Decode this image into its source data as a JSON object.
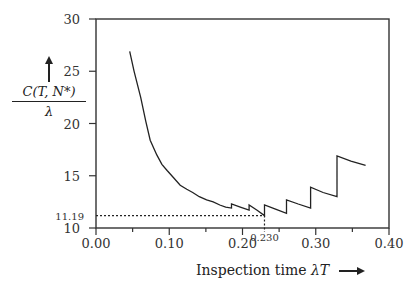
{
  "chart_data": {
    "type": "line",
    "title": "",
    "xlabel": "Inspection time λT",
    "ylabel": "C(T, N*) / λ",
    "ylabel_parts": {
      "numerator": "C(T, N*)",
      "denominator": "λ"
    },
    "xlim": [
      0.0,
      0.4
    ],
    "ylim": [
      10,
      30
    ],
    "grid": false,
    "legend": null,
    "x_ticks": [
      0.0,
      0.05,
      0.1,
      0.15,
      0.2,
      0.25,
      0.3,
      0.35,
      0.4
    ],
    "x_tick_labels": [
      "0.00",
      "",
      "0.10",
      "",
      "0.20",
      "",
      "0.30",
      "",
      "0.40"
    ],
    "y_ticks": [
      10,
      15,
      20,
      25,
      30
    ],
    "y_tick_labels": [
      "10",
      "15",
      "20",
      "25",
      "30"
    ],
    "series": [
      {
        "name": "C(T,N*)/λ",
        "style": "step-sawtooth",
        "x": [
          0.046,
          0.052,
          0.061,
          0.068,
          0.074,
          0.083,
          0.09,
          0.097,
          0.106,
          0.115,
          0.124,
          0.132,
          0.141,
          0.151,
          0.16,
          0.169,
          0.177,
          0.185,
          0.185,
          0.197,
          0.209,
          0.209,
          0.22,
          0.23,
          0.23,
          0.245,
          0.26,
          0.26,
          0.276,
          0.293,
          0.293,
          0.31,
          0.329,
          0.329,
          0.348,
          0.368
        ],
        "y": [
          26.9,
          25.0,
          22.5,
          20.2,
          18.4,
          17.0,
          16.1,
          15.5,
          14.8,
          14.1,
          13.7,
          13.4,
          13.0,
          12.7,
          12.5,
          12.2,
          12.0,
          11.9,
          12.3,
          12.0,
          11.7,
          12.2,
          11.7,
          11.19,
          12.2,
          11.8,
          11.4,
          12.7,
          12.3,
          11.9,
          13.9,
          13.4,
          13.0,
          16.9,
          16.4,
          16.0
        ]
      }
    ],
    "annotations": [
      {
        "type": "hline-dotted",
        "y": 11.19,
        "x_from": 0.0,
        "x_to": 0.23,
        "label": "11.19"
      },
      {
        "type": "vline-dotted",
        "x": 0.23,
        "y_from": 10,
        "y_to": 11.19,
        "label": "0.230"
      }
    ],
    "minimum": {
      "x": 0.23,
      "y": 11.19
    }
  },
  "labels": {
    "ylabel_numerator": "C(T, N*)",
    "ylabel_denominator": "λ",
    "xlabel_text": "Inspection time ",
    "xlabel_symbol": "λT",
    "min_y_label": "11.19",
    "min_x_label": "0.230"
  },
  "colors": {
    "line": "#222222",
    "axis": "#333333",
    "background": "#ffffff"
  }
}
